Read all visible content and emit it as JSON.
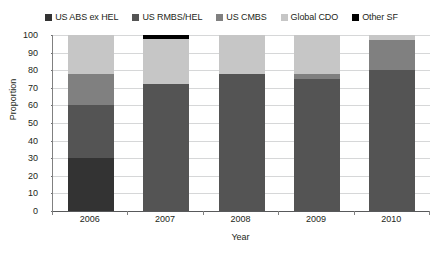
{
  "chart_data": {
    "type": "bar",
    "subtype": "stacked-bar",
    "title": "",
    "xlabel": "Year",
    "ylabel": "Proportion",
    "categories": [
      "2006",
      "2007",
      "2008",
      "2009",
      "2010"
    ],
    "ylim": [
      0,
      100
    ],
    "yticks": [
      0,
      10,
      20,
      30,
      40,
      50,
      60,
      70,
      80,
      90,
      100
    ],
    "grid": true,
    "legend_position": "top",
    "stack_order_bottom_to_top": [
      "US ABS ex HEL",
      "US RMBS/HEL",
      "US CMBS",
      "Global CDO",
      "Other SF"
    ],
    "series": [
      {
        "name": "US ABS ex HEL",
        "color": "#333333",
        "values": [
          30,
          0,
          0,
          0,
          0
        ]
      },
      {
        "name": "US RMBS/HEL",
        "color": "#545454",
        "values": [
          30,
          72,
          78,
          75,
          80
        ]
      },
      {
        "name": "US CMBS",
        "color": "#808080",
        "values": [
          18,
          0,
          0,
          3,
          17
        ]
      },
      {
        "name": "Global CDO",
        "color": "#c6c6c6",
        "values": [
          22,
          26,
          22,
          22,
          3
        ]
      },
      {
        "name": "Other SF",
        "color": "#000000",
        "values": [
          0,
          2,
          0,
          0,
          0
        ]
      }
    ]
  },
  "legend": {
    "items": [
      {
        "label": "US ABS ex HEL",
        "color": "#333333"
      },
      {
        "label": "US RMBS/HEL",
        "color": "#545454"
      },
      {
        "label": "US CMBS",
        "color": "#808080"
      },
      {
        "label": "Global CDO",
        "color": "#c6c6c6"
      },
      {
        "label": "Other SF",
        "color": "#000000"
      }
    ]
  }
}
